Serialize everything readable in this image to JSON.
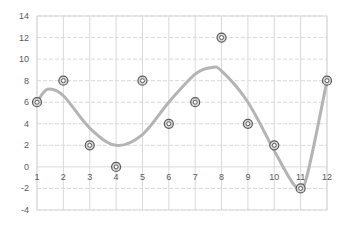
{
  "chart_data": {
    "type": "scatter",
    "title": "",
    "xlabel": "",
    "ylabel": "",
    "x": [
      1,
      2,
      3,
      4,
      5,
      6,
      7,
      8,
      9,
      10,
      11,
      12
    ],
    "series": [
      {
        "name": "Data points",
        "values": [
          6,
          8,
          2,
          0,
          8,
          4,
          6,
          12,
          4,
          2,
          -2,
          8
        ],
        "marker": "double-circle",
        "color": "#595959"
      },
      {
        "name": "Trendline (smooth fit)",
        "type": "line",
        "color": "#b4b4b4",
        "curve_points": [
          [
            1,
            6
          ],
          [
            1.4,
            7.2
          ],
          [
            2,
            6.6
          ],
          [
            3,
            3.6
          ],
          [
            4,
            2.0
          ],
          [
            5,
            3.0
          ],
          [
            6,
            6.0
          ],
          [
            7,
            8.6
          ],
          [
            7.6,
            9.2
          ],
          [
            8,
            8.9
          ],
          [
            9,
            6.0
          ],
          [
            10,
            1.5
          ],
          [
            10.8,
            -1.8
          ],
          [
            11.2,
            -1.2
          ],
          [
            12,
            8
          ]
        ]
      }
    ],
    "x_ticks": [
      "1",
      "2",
      "3",
      "4",
      "5",
      "6",
      "7",
      "8",
      "9",
      "10",
      "11",
      "12"
    ],
    "y_ticks": [
      "14",
      "12",
      "10",
      "8",
      "6",
      "4",
      "2",
      "0",
      "-2",
      "-4"
    ],
    "xlim": [
      1,
      12
    ],
    "ylim": [
      -4,
      14
    ],
    "grid": true,
    "legend": "none"
  },
  "colors": {
    "grid": "#d9d9d9",
    "axis_text": "#595959",
    "trend": "#b4b4b4",
    "marker": "#595959"
  }
}
